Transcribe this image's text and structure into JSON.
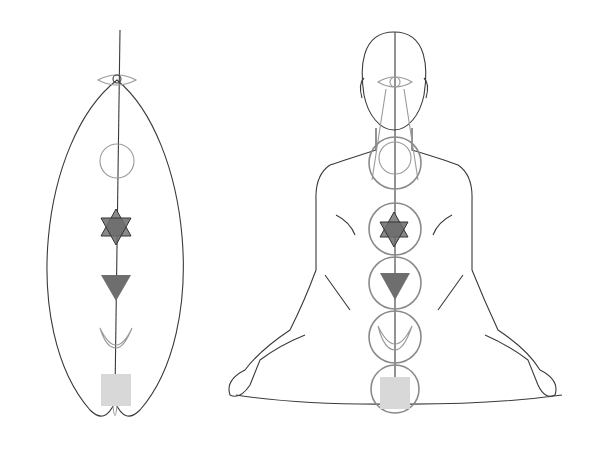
{
  "figure": {
    "type": "chakra-diagram",
    "panels": [
      {
        "name": "left-mandorla",
        "description": "Abstract almond outline with vertical axis"
      },
      {
        "name": "right-seated-figure",
        "description": "Seated meditating figure with chakra circles along spine"
      }
    ],
    "chakras": [
      {
        "id": "ajna",
        "symbol": "eye",
        "fill": "none"
      },
      {
        "id": "vishuddha",
        "symbol": "circle",
        "fill": "none"
      },
      {
        "id": "anahata",
        "symbol": "hexagram",
        "fill": "#6b6b6b"
      },
      {
        "id": "manipura",
        "symbol": "down-triangle",
        "fill": "#6e6e6e"
      },
      {
        "id": "svadhisthana",
        "symbol": "crescent",
        "fill": "none"
      },
      {
        "id": "muladhara",
        "symbol": "square",
        "fill": "#d8d8d8"
      }
    ],
    "colors": {
      "line": "#3a3a3a",
      "light_line": "#9a9a9a",
      "dark_fill": "#6b6b6b",
      "light_fill": "#d8d8d8",
      "background": "#ffffff"
    }
  }
}
